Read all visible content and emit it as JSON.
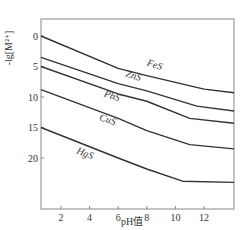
{
  "chart_data": {
    "type": "line",
    "title": "",
    "xlabel": "pH值",
    "ylabel": "-lg[M2+]",
    "ylabel_display": "-lg[M²⁺]",
    "xlim": [
      0.6,
      14
    ],
    "ylim": [
      28,
      -2.5
    ],
    "y_inverted": true,
    "grid": false,
    "x_ticks": [
      2,
      4,
      6,
      8,
      10,
      12
    ],
    "y_ticks": [
      0,
      5,
      10,
      15,
      20
    ],
    "series": [
      {
        "name": "FeS",
        "points": [
          [
            0.6,
            0
          ],
          [
            6,
            5.3
          ],
          [
            8,
            6.5
          ],
          [
            12,
            8.7
          ],
          [
            14,
            9.3
          ]
        ],
        "label_at": [
          8.5,
          5.2
        ],
        "label_rotate": 18
      },
      {
        "name": "ZnS",
        "points": [
          [
            0.6,
            3.5
          ],
          [
            6,
            7.8
          ],
          [
            8,
            9.0
          ],
          [
            11.5,
            11.5
          ],
          [
            14,
            12.3
          ]
        ],
        "label_at": [
          7.0,
          7.0
        ],
        "label_rotate": 18
      },
      {
        "name": "PbS",
        "points": [
          [
            0.6,
            5.0
          ],
          [
            6,
            9.5
          ],
          [
            8,
            10.7
          ],
          [
            11,
            13.5
          ],
          [
            14,
            14.3
          ]
        ],
        "label_at": [
          5.5,
          10.3
        ],
        "label_rotate": 18
      },
      {
        "name": "CuS",
        "points": [
          [
            0.6,
            8.8
          ],
          [
            6,
            13.5
          ],
          [
            8,
            15.5
          ],
          [
            11,
            17.8
          ],
          [
            14,
            18.5
          ]
        ],
        "label_at": [
          5.2,
          14.2
        ],
        "label_rotate": 18
      },
      {
        "name": "HgS",
        "points": [
          [
            0.6,
            15.0
          ],
          [
            6,
            20.0
          ],
          [
            8,
            21.8
          ],
          [
            10.5,
            23.8
          ],
          [
            14,
            24.0
          ]
        ],
        "label_at": [
          3.6,
          19.7
        ],
        "label_rotate": 22
      }
    ],
    "line_color": "#333333",
    "axis_color": "#888888"
  }
}
